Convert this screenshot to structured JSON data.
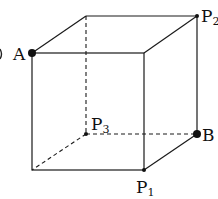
{
  "diagram": {
    "type": "cube",
    "vertices": {
      "front_top_left": {
        "x": 32,
        "y": 53,
        "label": "A",
        "dot": "large"
      },
      "front_top_right": {
        "x": 144,
        "y": 53,
        "label": "",
        "dot": "none"
      },
      "front_bottom_right": {
        "x": 144,
        "y": 170,
        "label": "P1",
        "dot": "small"
      },
      "front_bottom_left": {
        "x": 32,
        "y": 170,
        "label": "",
        "dot": "none"
      },
      "back_top_left": {
        "x": 86,
        "y": 16,
        "label": "",
        "dot": "none"
      },
      "back_top_right": {
        "x": 197,
        "y": 16,
        "label": "P2",
        "dot": "small"
      },
      "back_bottom_right": {
        "x": 197,
        "y": 134,
        "label": "B",
        "dot": "large"
      },
      "back_bottom_left": {
        "x": 86,
        "y": 134,
        "label": "P3",
        "dot": "small"
      }
    },
    "labels": {
      "A": {
        "main": "A",
        "sub": ""
      },
      "B": {
        "main": "B",
        "sub": ""
      },
      "P1": {
        "main": "P",
        "sub": "1"
      },
      "P2": {
        "main": "P",
        "sub": "2"
      },
      "P3": {
        "main": "P",
        "sub": "3"
      }
    },
    "hidden_edges": [
      "back_top_left-back_bottom_left",
      "back_bottom_left-back_bottom_right",
      "back_bottom_left-front_bottom_left"
    ],
    "line_color": "#1a1a1a"
  }
}
